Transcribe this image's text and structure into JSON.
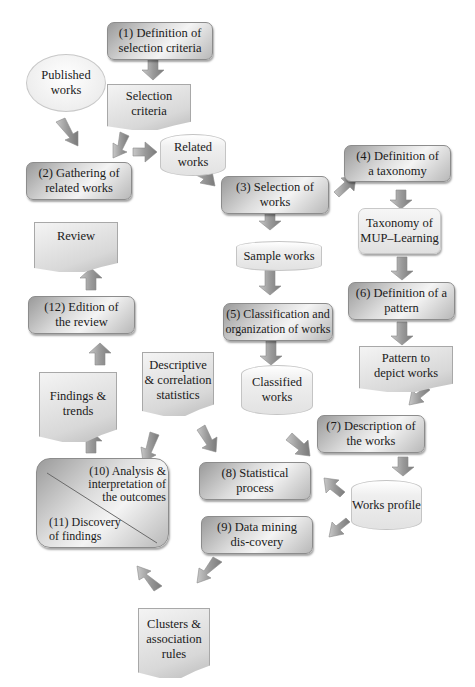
{
  "diagram": {
    "nodes": {
      "n1": "(1) Definition of selection criteria",
      "published": "Published works",
      "selection_criteria": "Selection criteria",
      "n2": "(2) Gathering of related works",
      "related_works": "Related works",
      "n3": "(3) Selection of works",
      "n4": "(4) Definition of a taxonomy",
      "taxonomy": "Taxonomy of MUP–Learning",
      "sample_works": "Sample works",
      "n5": "(5) Classification and organization of works",
      "n6": "(6) Definition of a pattern",
      "pattern": "Pattern to depict works",
      "classified_works": "Classified works",
      "n7": "(7) Description of the works",
      "works_profile": "Works profile",
      "n8": "(8) Statistical process",
      "n9": "(9) Data mining dis-covery",
      "n10": "(10) Analysis & interpretation of the outcomes",
      "n11": "(11) Discovery of findings",
      "descriptive": "Descriptive & correlation statistics",
      "findings": "Findings & trends",
      "n12": "(12) Edition of the review",
      "review": "Review",
      "clusters": "Clusters & association rules"
    },
    "colors": {
      "box_dark": "#9a9a9a",
      "box_light": "#f4f4f4",
      "arrow": "#9e9e9e",
      "border": "#8c8c8c"
    }
  }
}
